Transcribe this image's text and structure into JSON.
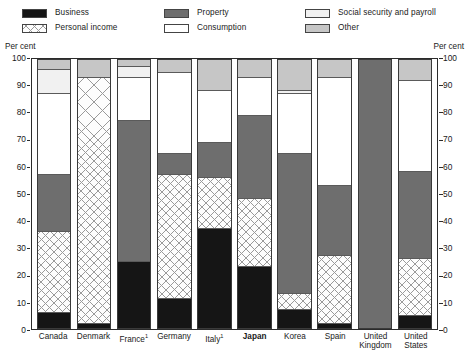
{
  "legend": {
    "columns": [
      [
        {
          "label": "Business",
          "key": "business"
        },
        {
          "label": "Personal income",
          "key": "personal"
        }
      ],
      [
        {
          "label": "Property",
          "key": "property"
        },
        {
          "label": "Consumption",
          "key": "consumption"
        }
      ],
      [
        {
          "label": "Social security and payroll",
          "key": "social"
        },
        {
          "label": "Other",
          "key": "other"
        }
      ]
    ]
  },
  "axis": {
    "unit_label_left": "Per cent",
    "unit_label_right": "Per cent",
    "ticks": [
      0,
      10,
      20,
      30,
      40,
      50,
      60,
      70,
      80,
      90,
      100
    ]
  },
  "colors": {
    "business": "#151515",
    "personal_income": "#fdfdfd",
    "personal_income_hatch": "#9a9a9a",
    "property": "#6e6e6e",
    "consumption": "#ffffff",
    "social_security": "#f1f1f1",
    "other": "#c6c6c6",
    "axis": "#2b2b2b"
  },
  "chart_data": {
    "type": "bar",
    "title": "",
    "subtitle": "",
    "xlabel": "",
    "ylabel": "Per cent",
    "ylim": [
      0,
      100
    ],
    "yticks": [
      0,
      10,
      20,
      30,
      40,
      50,
      60,
      70,
      80,
      90,
      100
    ],
    "grid": false,
    "stacked": true,
    "stack_total": 100,
    "legend_position": "top",
    "categories": [
      "Canada",
      "Denmark",
      "France",
      "Germany",
      "Italy",
      "Japan",
      "Korea",
      "Spain",
      "United Kingdom",
      "United States"
    ],
    "category_labels": [
      {
        "text": "Canada",
        "footnote": "",
        "bold": false
      },
      {
        "text": "Denmark",
        "footnote": "",
        "bold": false
      },
      {
        "text": "France",
        "footnote": "1",
        "bold": false
      },
      {
        "text": "Germany",
        "footnote": "",
        "bold": false
      },
      {
        "text": "Italy",
        "footnote": "1",
        "bold": false
      },
      {
        "text": "Japan",
        "footnote": "",
        "bold": true
      },
      {
        "text": "Korea",
        "footnote": "",
        "bold": false
      },
      {
        "text": "Spain",
        "footnote": "",
        "bold": false
      },
      {
        "text": "United Kingdom",
        "footnote": "",
        "bold": false
      },
      {
        "text": "United States",
        "footnote": "",
        "bold": false
      }
    ],
    "series": [
      {
        "name": "Business",
        "key": "business",
        "values": [
          6,
          2,
          25,
          11,
          37,
          23,
          7,
          2,
          0,
          5
        ]
      },
      {
        "name": "Personal income",
        "key": "personal",
        "values": [
          30,
          91,
          0,
          46,
          19,
          25,
          6,
          25,
          0,
          21
        ]
      },
      {
        "name": "Property",
        "key": "property",
        "values": [
          21,
          0,
          52,
          8,
          13,
          31,
          52,
          26,
          100,
          32
        ]
      },
      {
        "name": "Consumption",
        "key": "consumption",
        "values": [
          30,
          0,
          16,
          30,
          19,
          14,
          22,
          40,
          0,
          34
        ]
      },
      {
        "name": "Social security and payroll",
        "key": "social",
        "values": [
          9,
          0,
          4,
          0,
          0,
          0,
          1,
          0,
          0,
          0
        ]
      },
      {
        "name": "Other",
        "key": "other",
        "values": [
          4,
          7,
          3,
          5,
          12,
          7,
          12,
          7,
          0,
          8
        ]
      }
    ]
  }
}
